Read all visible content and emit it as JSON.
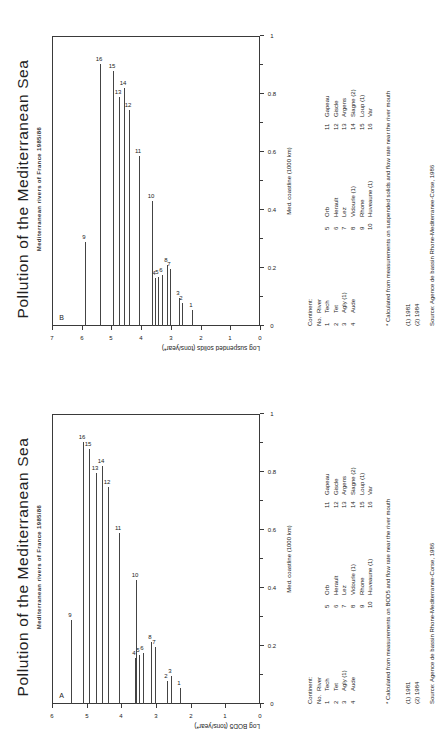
{
  "page": {
    "background": "#ffffff",
    "ink": "#222222"
  },
  "panels": [
    {
      "id": "panel-b",
      "letter": "B",
      "title": "Pollution of the Mediterranean Sea",
      "subtitle": "Mediterranean rivers of France  1985/86",
      "chart_data": {
        "type": "bar",
        "orientation": "horizontal-stem",
        "title": "Pollution of the Mediterranean Sea",
        "subtitle": "Mediterranean rivers of France  1985/86",
        "xlabel": "Med. coastline (1000 km)",
        "ylabel": "Log suspended solids (tons/year*)",
        "xlim": [
          0,
          1
        ],
        "ylim": [
          0,
          7
        ],
        "xticks": [
          0,
          0.2,
          0.4,
          0.6,
          0.8,
          1
        ],
        "xticklabels": [
          "0",
          "0.2",
          "0.4",
          "0.6",
          "0.8",
          "1"
        ],
        "yticks": [
          0,
          1,
          2,
          3,
          4,
          5,
          6,
          7
        ],
        "yticklabels": [
          "0",
          "1",
          "2",
          "3",
          "4",
          "5",
          "6",
          "7"
        ],
        "grid": false,
        "legend": "none",
        "note": "Each stem starts at the river position on the coastline axis and runs to x=0 (river mouth reference).",
        "points": [
          {
            "id": 1,
            "label": "1",
            "x": 0.055,
            "y": 2.3
          },
          {
            "id": 2,
            "label": "2",
            "x": 0.08,
            "y": 2.62
          },
          {
            "id": 3,
            "label": "3",
            "x": 0.095,
            "y": 2.72
          },
          {
            "id": 4,
            "label": "4",
            "x": 0.165,
            "y": 3.55
          },
          {
            "id": 5,
            "label": "5",
            "x": 0.17,
            "y": 3.42
          },
          {
            "id": 6,
            "label": "6",
            "x": 0.175,
            "y": 3.3
          },
          {
            "id": 7,
            "label": "7",
            "x": 0.198,
            "y": 3.02
          },
          {
            "id": 8,
            "label": "8",
            "x": 0.21,
            "y": 3.12
          },
          {
            "id": 9,
            "label": "9",
            "x": 0.29,
            "y": 5.9
          },
          {
            "id": 10,
            "label": "10",
            "x": 0.43,
            "y": 3.62
          },
          {
            "id": 11,
            "label": "11",
            "x": 0.585,
            "y": 4.08
          },
          {
            "id": 12,
            "label": "12",
            "x": 0.745,
            "y": 4.4
          },
          {
            "id": 13,
            "label": "13",
            "x": 0.79,
            "y": 4.75
          },
          {
            "id": 14,
            "label": "14",
            "x": 0.82,
            "y": 4.58
          },
          {
            "id": 15,
            "label": "15",
            "x": 0.88,
            "y": 4.95
          },
          {
            "id": 16,
            "label": "16",
            "x": 0.905,
            "y": 5.4
          }
        ]
      },
      "legend": {
        "header_label": "Continent:",
        "col_no": "No.",
        "col_river": "River",
        "columns": [
          [
            {
              "no": "1",
              "name": "Tech"
            },
            {
              "no": "2",
              "name": "Tet"
            },
            {
              "no": "3",
              "name": "Agly (1)"
            },
            {
              "no": "4",
              "name": "Aude"
            }
          ],
          [
            {
              "no": "5",
              "name": "Orb"
            },
            {
              "no": "6",
              "name": "Herault"
            },
            {
              "no": "7",
              "name": "Lez"
            },
            {
              "no": "8",
              "name": "Vidourle (1)"
            },
            {
              "no": "9",
              "name": "Rhone"
            },
            {
              "no": "10",
              "name": "Huveaune (1)"
            }
          ],
          [
            {
              "no": "11",
              "name": "Gapeau"
            },
            {
              "no": "12",
              "name": "Giscle"
            },
            {
              "no": "13",
              "name": "Argens"
            },
            {
              "no": "14",
              "name": "Siagne (2)"
            },
            {
              "no": "15",
              "name": "Loup (1)"
            },
            {
              "no": "16",
              "name": "Var"
            }
          ]
        ]
      },
      "notes": {
        "asterisk": "* Calculated from measurements on suspended solids and flow rate near the river mouth",
        "fn1": "(1) 1981",
        "fn2": "(2) 1984",
        "source": "Source: Agence de bassin Rhone-Mediterranee-Corse, 1986"
      }
    },
    {
      "id": "panel-a",
      "letter": "A",
      "title": "Pollution of the Mediterranean Sea",
      "subtitle": "Mediterranean rivers of France  1985/86",
      "chart_data": {
        "type": "bar",
        "orientation": "horizontal-stem",
        "title": "Pollution of the Mediterranean Sea",
        "subtitle": "Mediterranean rivers of France  1985/86",
        "xlabel": "Med. coastline (1000 km)",
        "ylabel": "Log BOD5 (tons/year*)",
        "xlim": [
          0,
          1
        ],
        "ylim": [
          0,
          6
        ],
        "xticks": [
          0,
          0.2,
          0.4,
          0.6,
          0.8,
          1
        ],
        "xticklabels": [
          "0",
          "0.2",
          "0.4",
          "0.6",
          "0.8",
          "1"
        ],
        "yticks": [
          0,
          1,
          2,
          3,
          4,
          5,
          6
        ],
        "yticklabels": [
          "0",
          "1",
          "2",
          "3",
          "4",
          "5",
          "6"
        ],
        "grid": false,
        "legend": "none",
        "note": "Each stem starts at the river position on the coastline axis and runs to x=0 (river mouth reference).",
        "points": [
          {
            "id": 1,
            "label": "1",
            "x": 0.055,
            "y": 2.3
          },
          {
            "id": 2,
            "label": "2",
            "x": 0.078,
            "y": 2.68
          },
          {
            "id": 3,
            "label": "3",
            "x": 0.098,
            "y": 2.56
          },
          {
            "id": 4,
            "label": "4",
            "x": 0.16,
            "y": 3.62
          },
          {
            "id": 5,
            "label": "5",
            "x": 0.168,
            "y": 3.5
          },
          {
            "id": 6,
            "label": "6",
            "x": 0.176,
            "y": 3.38
          },
          {
            "id": 7,
            "label": "7",
            "x": 0.196,
            "y": 3.03
          },
          {
            "id": 8,
            "label": "8",
            "x": 0.215,
            "y": 3.14
          },
          {
            "id": 9,
            "label": "9",
            "x": 0.288,
            "y": 5.45
          },
          {
            "id": 10,
            "label": "10",
            "x": 0.428,
            "y": 3.58
          },
          {
            "id": 11,
            "label": "11",
            "x": 0.588,
            "y": 4.06
          },
          {
            "id": 12,
            "label": "12",
            "x": 0.748,
            "y": 4.38
          },
          {
            "id": 13,
            "label": "13",
            "x": 0.795,
            "y": 4.72
          },
          {
            "id": 14,
            "label": "14",
            "x": 0.822,
            "y": 4.56
          },
          {
            "id": 15,
            "label": "15",
            "x": 0.878,
            "y": 4.92
          },
          {
            "id": 16,
            "label": "16",
            "x": 0.905,
            "y": 5.12
          }
        ]
      },
      "legend": {
        "header_label": "Continent:",
        "col_no": "No.",
        "col_river": "River",
        "columns": [
          [
            {
              "no": "1",
              "name": "Tech"
            },
            {
              "no": "2",
              "name": "Tet"
            },
            {
              "no": "3",
              "name": "Agly (1)"
            },
            {
              "no": "4",
              "name": "Aude"
            }
          ],
          [
            {
              "no": "5",
              "name": "Orb"
            },
            {
              "no": "6",
              "name": "Herault"
            },
            {
              "no": "7",
              "name": "Lez"
            },
            {
              "no": "8",
              "name": "Vidourle (1)"
            },
            {
              "no": "9",
              "name": "Rhone"
            },
            {
              "no": "10",
              "name": "Huveaune (1)"
            }
          ],
          [
            {
              "no": "11",
              "name": "Gapeau"
            },
            {
              "no": "12",
              "name": "Giscle"
            },
            {
              "no": "13",
              "name": "Argens"
            },
            {
              "no": "14",
              "name": "Siagne (2)"
            },
            {
              "no": "15",
              "name": "Loup (1)"
            },
            {
              "no": "16",
              "name": "Var"
            }
          ]
        ]
      },
      "notes": {
        "asterisk": "* Calculated from measurements on BOD5 and flow rate near the river mouth",
        "fn1": "(1) 1981",
        "fn2": "(2) 1984",
        "source": "Source: Agence de bassin Rhone-Mediterranee-Corse, 1986"
      }
    }
  ]
}
